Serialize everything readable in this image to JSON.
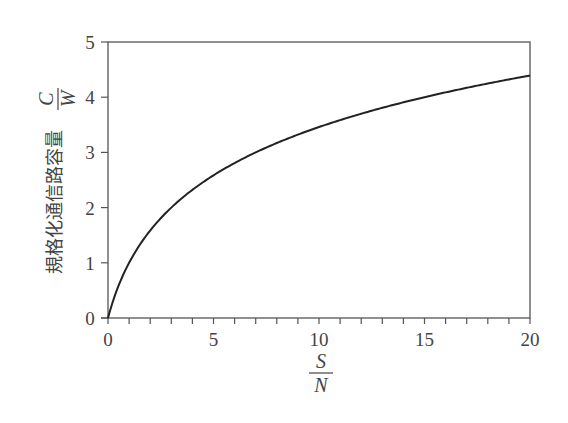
{
  "chart_data": {
    "type": "line",
    "title": "",
    "function": "log2(1 + S/N)",
    "xlabel": {
      "numerator": "S",
      "denominator": "N"
    },
    "ylabel": {
      "text": "規格化通信路容量",
      "numerator": "C",
      "denominator": "W"
    },
    "xlim": [
      0,
      20
    ],
    "ylim": [
      0,
      5
    ],
    "xticks": [
      0,
      5,
      10,
      15,
      20
    ],
    "xtick_labels": [
      "0",
      "5",
      "10",
      "15",
      "20"
    ],
    "x_minor_step": 1,
    "yticks": [
      0,
      1,
      2,
      3,
      4,
      5
    ],
    "ytick_labels": [
      "0",
      "1",
      "2",
      "3",
      "4",
      "5"
    ],
    "grid": false,
    "legend": "none",
    "series": [
      {
        "name": "C/W",
        "x": [
          0,
          0.5,
          1,
          2,
          3,
          4,
          5,
          6,
          7,
          8,
          9,
          10,
          11,
          12,
          13,
          14,
          15,
          16,
          17,
          18,
          19,
          20
        ],
        "values": [
          0,
          0.585,
          1.0,
          1.585,
          2.0,
          2.322,
          2.585,
          2.807,
          3.0,
          3.17,
          3.322,
          3.459,
          3.585,
          3.7,
          3.807,
          3.907,
          4.0,
          4.087,
          4.17,
          4.248,
          4.322,
          4.392
        ]
      }
    ],
    "colors": {
      "axis": "#555555",
      "line": "#222222",
      "text": "#444444"
    }
  }
}
